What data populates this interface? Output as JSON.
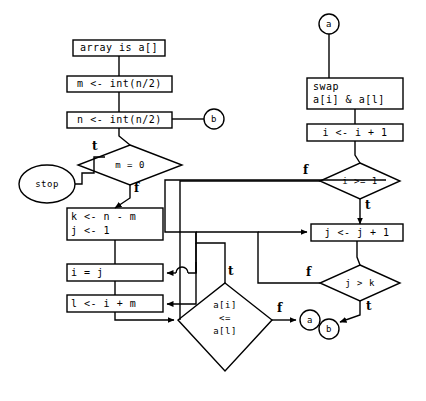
{
  "diagram": {
    "stroke_color": "#000000",
    "fill_color": "#ffffff",
    "background": "#ffffff",
    "nodes": {
      "array_is": {
        "text": "array is a[]",
        "shape": "process"
      },
      "m_assign": {
        "text": "m <- int(n/2)",
        "shape": "process"
      },
      "n_assign": {
        "text": "n <- int(n/2)",
        "shape": "process"
      },
      "m_eq_0": {
        "text": "m = 0",
        "shape": "decision"
      },
      "stop": {
        "text": "stop",
        "shape": "terminator"
      },
      "k_j_init_line1": {
        "text": "k <- n - m",
        "shape": "process"
      },
      "k_j_init_line2": {
        "text": "j <- 1",
        "shape": "process"
      },
      "i_eq_j": {
        "text": "i = j",
        "shape": "process"
      },
      "l_assign": {
        "text": "l <- i + m",
        "shape": "process"
      },
      "compare_line1": {
        "text": "a[i]",
        "shape": "decision"
      },
      "compare_line2": {
        "text": "<=",
        "shape": "decision"
      },
      "compare_line3": {
        "text": "a[l]",
        "shape": "decision"
      },
      "swap_line1": {
        "text": "swap",
        "shape": "process"
      },
      "swap_line2": {
        "text": "a[i] & a[l]",
        "shape": "process"
      },
      "i_dec": {
        "text": "i <- i + 1",
        "shape": "process"
      },
      "i_ge_1": {
        "text": "i >= 1",
        "shape": "decision"
      },
      "j_inc": {
        "text": "j <- j + 1",
        "shape": "process"
      },
      "j_gt_k": {
        "text": "j > k",
        "shape": "decision"
      },
      "conn_a_top": {
        "text": "a",
        "shape": "connector"
      },
      "conn_b_right": {
        "text": "b",
        "shape": "connector"
      },
      "conn_a_bottom": {
        "text": "a",
        "shape": "connector"
      },
      "conn_b_bottom": {
        "text": "b",
        "shape": "connector"
      }
    },
    "edge_labels": {
      "m_eq_0_true": "t",
      "m_eq_0_false": "f",
      "compare_true": "t",
      "compare_false": "f",
      "i_ge_1_false": "f",
      "i_ge_1_true": "t",
      "j_gt_k_false": "f",
      "j_gt_k_true": "t"
    }
  }
}
